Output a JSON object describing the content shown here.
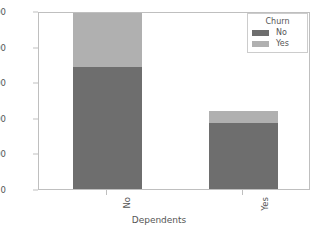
{
  "chart_data": {
    "type": "bar",
    "stacked": true,
    "title": "",
    "xlabel": "Dependents",
    "ylabel": "",
    "categories": [
      "No",
      "Yes"
    ],
    "series": [
      {
        "name": "No",
        "values": [
          3430,
          1850
        ],
        "color": "#6e6e6e"
      },
      {
        "name": "Yes",
        "values": [
          1520,
          340
        ],
        "color": "#b0b0b0"
      }
    ],
    "totals": [
      4950,
      2190
    ],
    "legend": {
      "title": "Churn",
      "position": "upper right",
      "entries": [
        "No",
        "Yes"
      ]
    },
    "yticks": [
      0,
      1000,
      2000,
      3000,
      4000,
      5000
    ],
    "ylim": [
      0,
      5000
    ],
    "xtick_rotation": 90,
    "grid": false,
    "background": "#ffffff",
    "frame_color": "#bfbfbf",
    "tick_label_color": "#555555"
  }
}
